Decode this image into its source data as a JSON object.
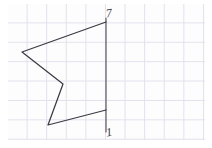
{
  "figure": {
    "background_color": "#fdfdfe",
    "grid_line_color": "#e3e0ec",
    "stroke_color": "#3b3b44",
    "grid_cell_px": 19.5,
    "labels": {
      "top": "7",
      "bottom": "1"
    },
    "vertical_line": {
      "name": "axis-line",
      "x": 106,
      "y_top": 18,
      "y_bottom": 132
    },
    "polygon": {
      "name": "arrow-polygon",
      "closed": false,
      "points": [
        {
          "x": 106,
          "y": 22,
          "label": "top-right"
        },
        {
          "x": 22,
          "y": 52,
          "label": "left"
        },
        {
          "x": 63,
          "y": 84,
          "label": "notch"
        },
        {
          "x": 48,
          "y": 125,
          "label": "bottom-left"
        },
        {
          "x": 106,
          "y": 110,
          "label": "bottom-right"
        }
      ]
    }
  },
  "chart_data": {
    "type": "scatter",
    "xlabel": "",
    "ylabel": "",
    "x": [
      106,
      22,
      63,
      48,
      106
    ],
    "y": [
      22,
      52,
      84,
      125,
      110
    ],
    "series": [
      {
        "name": "arrow-polygon-outline",
        "values": [
          22,
          52,
          84,
          125,
          110
        ]
      }
    ],
    "annotations": [
      "7",
      "1"
    ],
    "grid": true,
    "legend": "none"
  }
}
